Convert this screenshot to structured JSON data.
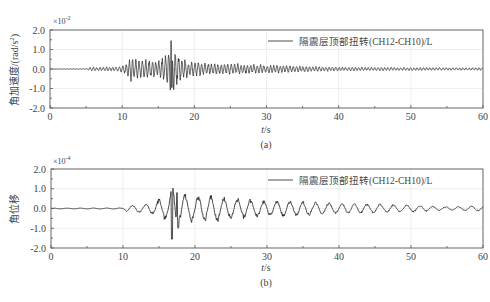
{
  "figure": {
    "panels": [
      {
        "id": "a",
        "caption": "(a)",
        "ylabel": "角加速度/(rad/s²)",
        "ylabel_cjk": "角加速度",
        "ylabel_unit": "/(rad/s",
        "ylabel_sup": "2",
        "ylabel_close": ")",
        "exponent_base": "×10",
        "exponent_power": "-2",
        "xlabel_italic": "t",
        "xlabel_rest": "/s",
        "legend": "隔震层顶部扭转(CH12-CH10)/L",
        "yticks": [
          "2.0",
          "1.0",
          "0.0",
          "-1.0",
          "-2.0"
        ],
        "xticks": [
          "0",
          "10",
          "20",
          "30",
          "40",
          "50",
          "60"
        ]
      },
      {
        "id": "b",
        "caption": "(b)",
        "ylabel": "角位移",
        "exponent_base": "×10",
        "exponent_power": "-4",
        "xlabel_italic": "t",
        "xlabel_rest": "/s",
        "legend": "隔震层顶部扭转(CH12-CH10)/L",
        "yticks": [
          "2.0",
          "1.0",
          "0.0",
          "-1.0",
          "-2.0"
        ],
        "xticks": [
          "0",
          "10",
          "20",
          "30",
          "40",
          "50",
          "60"
        ]
      }
    ],
    "colors": {
      "line": "#222222",
      "axis": "#555555",
      "grid": "#e6e6e6",
      "text": "#444444"
    }
  },
  "chart_data": [
    {
      "type": "line",
      "title": "(a)",
      "xlabel": "t/s",
      "ylabel": "角加速度/(rad/s²)",
      "y_scale_factor": "×10^-2",
      "xlim": [
        0,
        60
      ],
      "ylim": [
        -2.0,
        2.0
      ],
      "xticks": [
        0,
        10,
        20,
        30,
        40,
        50,
        60
      ],
      "yticks": [
        -2.0,
        -1.0,
        0.0,
        1.0,
        2.0
      ],
      "grid": true,
      "legend": [
        "隔震层顶部扭转(CH12-CH10)/L"
      ],
      "legend_position": "upper right",
      "series": [
        {
          "name": "隔震层顶部扭转(CH12-CH10)/L",
          "envelope_t": [
            0,
            5,
            5.5,
            9.5,
            10.5,
            11.3,
            13,
            15,
            16,
            16.8,
            17.5,
            18.5,
            20,
            23,
            27,
            32,
            35,
            40,
            50,
            60
          ],
          "envelope_amp": [
            0.01,
            0.02,
            0.1,
            0.12,
            0.25,
            0.65,
            0.5,
            0.4,
            0.7,
            1.4,
            0.8,
            0.55,
            0.35,
            0.3,
            0.25,
            0.2,
            0.15,
            0.1,
            0.08,
            0.07
          ],
          "peak_max": {
            "t": 16.8,
            "value": 1.45
          },
          "peak_min": {
            "t": 16.9,
            "value": -0.95
          },
          "freq_hz": 2.2
        }
      ]
    },
    {
      "type": "line",
      "title": "(b)",
      "xlabel": "t/s",
      "ylabel": "角位移",
      "y_scale_factor": "×10^-4",
      "xlim": [
        0,
        60
      ],
      "ylim": [
        -2.0,
        2.0
      ],
      "xticks": [
        0,
        10,
        20,
        30,
        40,
        50,
        60
      ],
      "yticks": [
        -2.0,
        -1.0,
        0.0,
        1.0,
        2.0
      ],
      "grid": true,
      "legend": [
        "隔震层顶部扭转(CH12-CH10)/L"
      ],
      "legend_position": "upper right",
      "series": [
        {
          "name": "隔震层顶部扭转(CH12-CH10)/L",
          "envelope_t": [
            0,
            10,
            10.5,
            12,
            14,
            15.5,
            16.5,
            17,
            18,
            20,
            22,
            25,
            28,
            30,
            33,
            35,
            40,
            45,
            50,
            55,
            60
          ],
          "envelope_amp": [
            0.02,
            0.03,
            0.15,
            0.2,
            0.3,
            0.6,
            0.75,
            1.5,
            0.8,
            0.7,
            0.75,
            0.6,
            0.5,
            0.45,
            0.45,
            0.4,
            0.3,
            0.25,
            0.2,
            0.1,
            0.15
          ],
          "peak_max": {
            "t": 17.5,
            "value": 0.8
          },
          "peak_min": {
            "t": 16.8,
            "value": -1.55
          },
          "freq_hz": 0.55
        }
      ]
    }
  ]
}
